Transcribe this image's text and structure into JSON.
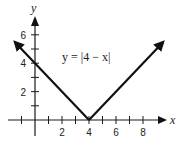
{
  "chart_data": {
    "type": "line",
    "title": "",
    "equation_label": "y = |4 − x|",
    "xlabel": "x",
    "ylabel": "y",
    "xlim": [
      -2,
      9.5
    ],
    "ylim": [
      -1,
      7.2
    ],
    "x_ticks": [
      -1,
      1,
      2,
      3,
      4,
      5,
      6,
      7,
      8
    ],
    "x_tick_labels": [
      "2",
      "4",
      "6",
      "8"
    ],
    "x_tick_label_values": [
      2,
      4,
      6,
      8
    ],
    "y_ticks": [
      1,
      2,
      3,
      4,
      5,
      6
    ],
    "y_tick_labels": [
      "2",
      "4",
      "6"
    ],
    "y_tick_label_values": [
      2,
      4,
      6
    ],
    "grid": false,
    "legend": null,
    "series": [
      {
        "name": "y = |4 − x|",
        "x": [
          -1.5,
          0,
          4,
          8,
          9.5
        ],
        "y": [
          5.5,
          4,
          0,
          4,
          5.5
        ],
        "arrows": "both-ends"
      }
    ],
    "key_points": [
      {
        "x": 0,
        "y": 4,
        "label": "y-intercept"
      },
      {
        "x": 4,
        "y": 0,
        "label": "vertex"
      }
    ],
    "colors": {
      "line": "#111111",
      "axis": "#1a1a1a",
      "background": "#ffffff"
    }
  }
}
